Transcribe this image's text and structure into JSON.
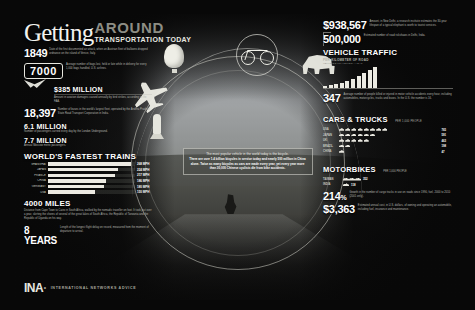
{
  "poster": {
    "title_main": "Getting",
    "title_accent": "AROUND",
    "subtitle": "TRANSPORTATION TODAY"
  },
  "left_column": {
    "stat_1849": {
      "number": "1849",
      "body": "Date of the first documented air attack, when an Austrian fleet of balloons dropped ordnance on the island of Venice, Italy."
    },
    "stat_7000": {
      "number": "7000",
      "body": "Average number of bags lost, held or late while in delivery for every 1,000 bags handled, U.S. airlines."
    },
    "stat_385m": {
      "number": "$385 MILLION",
      "body": "Amount in aviation damages caused annually by bird strikes, according to the FAA."
    },
    "stat_18397": {
      "number": "18,397",
      "body": "Number of buses in the world's largest fleet, operated by the Andhra Pradesh State Road Transport Corporation in India."
    },
    "stat_61m": {
      "number": "6.1 MILLION",
      "body": "Number of passengers carried every day by the London Underground."
    },
    "stat_77m": {
      "number": "7.7 MILLION",
      "body": "Annual Moscow metro passengers."
    },
    "stat_4000": {
      "number": "4000 MILES",
      "body": "Distance from Cape Town to Cairo in South Africa, walked by the nomadic traveller on foot. It took just over a year, skirting the shores of several of the great lakes of South Africa, the Republic of Tanzania and the Republic of Uganda on his way."
    },
    "stat_8years": {
      "number": "8 YEARS",
      "body": "Length of the longest flight delay on record, measured from the moment of departure to arrival."
    }
  },
  "trains_chart": {
    "title": "WORLD'S FASTEST TRAINS",
    "chart_data": {
      "type": "bar",
      "title": "WORLD'S FASTEST TRAINS",
      "orientation": "horizontal",
      "categories": [
        "SHANGHAI",
        "JAPAN",
        "FRANCE",
        "CHINA",
        "GERMANY",
        "USA"
      ],
      "values": [
        268,
        224,
        217,
        186,
        180,
        150
      ],
      "unit": "MPH",
      "value_labels": [
        "268 MPH",
        "224 MPH",
        "217 MPH",
        "186 MPH",
        "180 MPH",
        "150 MPH"
      ],
      "xlabel": "",
      "ylabel": "",
      "xlim": [
        0,
        280
      ],
      "grid": false,
      "legend": false
    }
  },
  "logo": {
    "mark": "INA",
    "dot": "·",
    "text": "INTERNATIONAL NETWORKS ADVICE"
  },
  "right_column": {
    "stat_938567": {
      "number": "$938,567",
      "body": "Amount, in New Delhi, a research institute estimates the 30-year lifespan of a typical elephant is worth to tourist services."
    },
    "stat_500000": {
      "number": "500,000",
      "body": "Estimated number of road rickshaws in Delhi, India."
    },
    "stat_347": {
      "number": "347",
      "body": "Average number of people killed or injured in motor vehicle accidents every hour, including automobiles, motorcycles, trucks and buses. In the U.S. the number is 16."
    },
    "stat_214": {
      "number": "214",
      "unit": "%",
      "body": "Growth in the number of cargo trucks in use on roads since 1990, fuel, 2000 to 2010 (2001 only)."
    },
    "stat_3363": {
      "number": "$3,363",
      "body": "Estimated annual cost, in U.S. dollars, of owning and operating an automobile, including fuel, insurance and maintenance."
    }
  },
  "vehicle_traffic": {
    "title": "VEHICLE TRAFFIC",
    "subtitle": "PER KILOMETER OF ROAD",
    "note": "VEHICLES TRAVELLED / YEAR",
    "chart_data": {
      "type": "bar",
      "title": "VEHICLE TRAFFIC",
      "categories": [
        "1960",
        "1965",
        "1970",
        "1975",
        "1980",
        "1985",
        "1990",
        "1995",
        "2000",
        "2005"
      ],
      "values": [
        8,
        12,
        18,
        24,
        32,
        44,
        56,
        70,
        86,
        100
      ],
      "xlabel": "",
      "ylabel": "",
      "ylim": [
        0,
        100
      ],
      "grid": false,
      "legend": false
    }
  },
  "cars_trucks": {
    "title": "CARS & TRUCKS",
    "note": "PER 1,000 PEOPLE",
    "chart_data": {
      "type": "bar",
      "title": "CARS & TRUCKS",
      "unit": "per 1,000 people",
      "categories": [
        "USA",
        "JAPAN",
        "UK",
        "BRAZIL",
        "CHINA"
      ],
      "values": [
        765,
        591,
        463,
        198,
        47
      ],
      "icon_counts": [
        8,
        6,
        5,
        2,
        1
      ],
      "value_labels": [
        "765",
        "591",
        "463",
        "198",
        "47"
      ],
      "grid": false,
      "legend": false
    }
  },
  "motorbikes": {
    "title": "MOTORBIKES",
    "note": "PER 1,000 PEOPLE",
    "chart_data": {
      "type": "bar",
      "title": "MOTORBIKES",
      "categories": [
        "TAIWAN",
        "INDIA"
      ],
      "values": [
        352,
        118
      ],
      "icon_counts": [
        3,
        1
      ],
      "value_labels": [
        "352",
        "118"
      ],
      "grid": false,
      "legend": false
    }
  },
  "center_caption": {
    "line1": "The most popular vehicle in the world today is the bicycle.",
    "line2": "There are over 1.4 billion bicycles in service today and nearly 500 million in China alone. Twice as many bicycles as cars are made every year, yet every year more than 30,000 Chinese cyclists die from bike accidents."
  },
  "icons": {
    "balloon": "hot-air-balloon",
    "plane": "airplane",
    "rocket": "rocket",
    "bicycle": "bicycle",
    "elephant": "elephant",
    "bird": "bird",
    "cyclist": "cyclist-photo"
  }
}
